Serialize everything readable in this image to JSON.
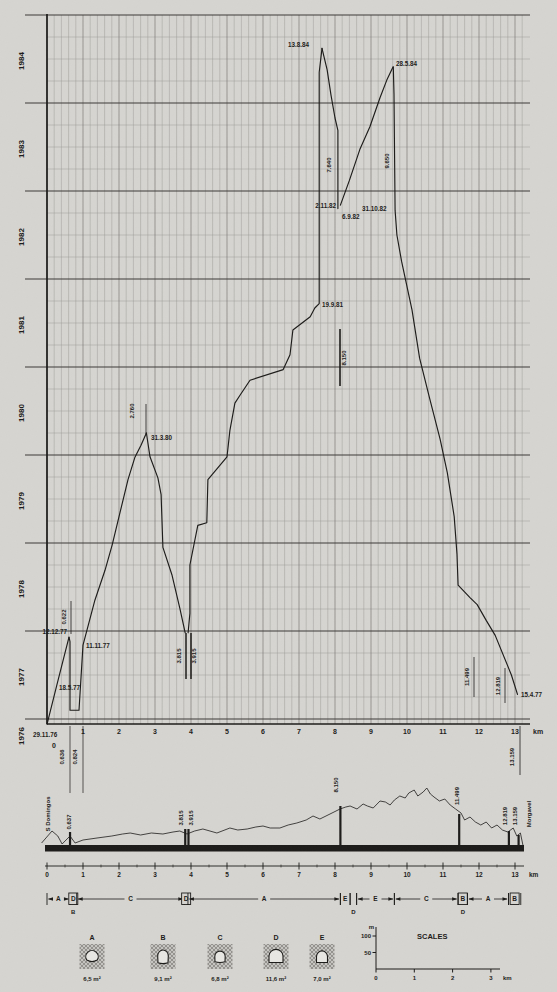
{
  "page": {
    "bg": "#d6d5d1",
    "ink": "#1c1b19",
    "grid_minor": "#9a9994",
    "grid_major": "#3c3b38"
  },
  "chart_data": {
    "type": "line",
    "x_unit": "km",
    "x_range": [
      0,
      13.4
    ],
    "x_ticks": [
      "0",
      "1",
      "2",
      "3",
      "4",
      "5",
      "6",
      "7",
      "8",
      "9",
      "10",
      "11",
      "12",
      "13"
    ],
    "year_labels": [
      "1976",
      "1977",
      "1978",
      "1979",
      "1980",
      "1981",
      "1982",
      "1983",
      "1984"
    ],
    "grid": "on",
    "series": [
      {
        "name": "S. Domingos portal heading",
        "points": [
          [
            0,
            1976.94
          ],
          [
            0.27,
            1977.38
          ],
          [
            0.61,
            1977.93
          ]
        ]
      },
      {
        "name": "adit 0.824 heading east",
        "points": [
          [
            0.61,
            1977.93
          ],
          [
            0.64,
            1977.88
          ],
          [
            0.64,
            1977.1
          ],
          [
            0.89,
            1977.1
          ],
          [
            1.0,
            1977.84
          ],
          [
            1.33,
            1978.35
          ],
          [
            1.61,
            1978.69
          ],
          [
            1.81,
            1978.98
          ],
          [
            2.03,
            1979.35
          ],
          [
            2.25,
            1979.72
          ],
          [
            2.44,
            1979.97
          ],
          [
            2.61,
            1980.11
          ],
          [
            2.76,
            1980.25
          ]
        ]
      },
      {
        "name": "adit 3.815 heading west",
        "points": [
          [
            2.76,
            1980.25
          ],
          [
            2.86,
            1979.98
          ],
          [
            3.08,
            1979.74
          ],
          [
            3.17,
            1979.55
          ],
          [
            3.22,
            1978.95
          ],
          [
            3.47,
            1978.64
          ],
          [
            3.69,
            1978.26
          ],
          [
            3.84,
            1977.98
          ]
        ]
      },
      {
        "name": "adit 3.915 heading east",
        "points": [
          [
            3.92,
            1977.98
          ],
          [
            3.97,
            1978.2
          ],
          [
            3.97,
            1978.75
          ],
          [
            4.19,
            1979.2
          ],
          [
            4.44,
            1979.23
          ],
          [
            4.47,
            1979.72
          ],
          [
            5.0,
            1979.98
          ],
          [
            5.08,
            1980.28
          ],
          [
            5.22,
            1980.59
          ],
          [
            5.36,
            1980.68
          ],
          [
            5.64,
            1980.85
          ],
          [
            6.56,
            1980.97
          ],
          [
            6.75,
            1981.14
          ],
          [
            6.83,
            1981.42
          ],
          [
            7.31,
            1981.57
          ],
          [
            7.44,
            1981.67
          ],
          [
            7.56,
            1981.72
          ],
          [
            7.56,
            1984.35
          ],
          [
            7.64,
            1984.62
          ]
        ]
      },
      {
        "name": "adit 8.150 heading west",
        "points": [
          [
            7.64,
            1984.62
          ],
          [
            7.78,
            1984.38
          ],
          [
            7.89,
            1984.09
          ],
          [
            8.0,
            1983.83
          ],
          [
            8.08,
            1983.69
          ],
          [
            8.08,
            1982.8
          ]
        ]
      },
      {
        "name": "adit 8.150 heading east",
        "points": [
          [
            8.15,
            1982.84
          ],
          [
            8.4,
            1983.12
          ],
          [
            8.69,
            1983.47
          ],
          [
            8.97,
            1983.73
          ],
          [
            9.25,
            1984.06
          ],
          [
            9.44,
            1984.26
          ],
          [
            9.61,
            1984.41
          ]
        ]
      },
      {
        "name": "Morgavel portal heading",
        "points": [
          [
            13.07,
            1977.28
          ],
          [
            12.9,
            1977.5
          ],
          [
            12.45,
            1977.95
          ],
          [
            12.2,
            1978.12
          ],
          [
            11.95,
            1978.3
          ],
          [
            11.75,
            1978.38
          ],
          [
            11.42,
            1978.52
          ],
          [
            11.39,
            1978.87
          ],
          [
            11.31,
            1979.3
          ],
          [
            11.12,
            1979.8
          ],
          [
            10.92,
            1980.18
          ],
          [
            10.63,
            1980.64
          ],
          [
            10.35,
            1981.1
          ],
          [
            10.14,
            1981.65
          ],
          [
            9.85,
            1982.2
          ],
          [
            9.72,
            1982.5
          ],
          [
            9.67,
            1982.78
          ],
          [
            9.65,
            1983.6
          ],
          [
            9.64,
            1984.1
          ],
          [
            9.62,
            1984.41
          ]
        ]
      }
    ],
    "date_labels": [
      {
        "t": "13.8.84",
        "x": 288,
        "y": 47,
        "a": "start"
      },
      {
        "t": "28.5.84",
        "x": 396,
        "y": 66,
        "a": "start"
      },
      {
        "t": "2.11.82",
        "x": 336,
        "y": 208,
        "a": "end"
      },
      {
        "t": "6.9.82",
        "x": 342,
        "y": 219,
        "a": "start"
      },
      {
        "t": "31.10.82",
        "x": 362,
        "y": 211,
        "a": "start"
      },
      {
        "t": "19.9.81",
        "x": 322,
        "y": 307,
        "a": "start"
      },
      {
        "t": "31.3.80",
        "x": 151,
        "y": 440,
        "a": "start"
      },
      {
        "t": "12.12.77",
        "x": 67,
        "y": 634,
        "a": "end"
      },
      {
        "t": "11.11.77",
        "x": 86,
        "y": 648,
        "a": "start"
      },
      {
        "t": "18.5.77",
        "x": 59,
        "y": 690,
        "a": "start"
      },
      {
        "t": "29.11.76",
        "x": 33,
        "y": 737,
        "a": "start"
      },
      {
        "t": "15.4.77",
        "x": 521,
        "y": 697,
        "a": "start"
      }
    ],
    "chainage_labels": [
      {
        "t": "0.622",
        "x": 66,
        "y": 617,
        "line": [
          71,
          601,
          634
        ],
        "lw": 0.8
      },
      {
        "t": "2.760",
        "x": 134,
        "y": 411,
        "line": [
          146,
          404,
          434
        ],
        "lw": 0.8
      },
      {
        "t": "3.815",
        "x": 181,
        "y": 656,
        "line": [
          186,
          633,
          679
        ],
        "lw": 1.5
      },
      {
        "t": "3.915",
        "x": 196,
        "y": 656,
        "line": [
          191,
          633,
          679
        ],
        "lw": 1.5
      },
      {
        "t": "7.640",
        "x": 331,
        "y": 165
      },
      {
        "t": "8.150",
        "x": 346,
        "y": 358,
        "line": [
          340,
          329,
          386
        ],
        "lw": 1.6
      },
      {
        "t": "9.650",
        "x": 389,
        "y": 161
      },
      {
        "t": "11.499",
        "x": 469,
        "y": 677,
        "line": [
          474,
          657,
          697
        ],
        "lw": 0.8
      },
      {
        "t": "12.819",
        "x": 500,
        "y": 686,
        "line": [
          505,
          668,
          703
        ],
        "lw": 0.8
      },
      {
        "t": "0.636",
        "x": 64,
        "y": 757,
        "line": [
          70,
          726,
          793
        ],
        "lw": 0.7
      },
      {
        "t": "0.824",
        "x": 77,
        "y": 757,
        "line": [
          83,
          726,
          793
        ],
        "lw": 0.7
      },
      {
        "t": "13.159",
        "x": 514,
        "y": 757,
        "line": [
          520,
          726,
          775
        ],
        "lw": 0.8
      }
    ],
    "x_axis_unit_label": "km",
    "zero_tick": {
      "t": "0",
      "x": 54,
      "y": 748
    }
  },
  "profile": {
    "left_name": "S Domingos",
    "right_name": "Morgavel",
    "terrain": [
      [
        -0.15,
        3
      ],
      [
        0.14,
        15
      ],
      [
        0.3,
        10
      ],
      [
        0.42,
        2
      ],
      [
        0.64,
        10
      ],
      [
        0.78,
        3
      ],
      [
        1.0,
        6
      ],
      [
        1.39,
        8
      ],
      [
        1.8,
        10
      ],
      [
        2.1,
        12
      ],
      [
        2.31,
        13
      ],
      [
        2.6,
        11
      ],
      [
        2.9,
        13
      ],
      [
        3.22,
        12
      ],
      [
        3.5,
        14
      ],
      [
        3.69,
        15
      ],
      [
        3.89,
        12
      ],
      [
        4.1,
        15
      ],
      [
        4.33,
        17
      ],
      [
        4.72,
        13
      ],
      [
        5.08,
        18
      ],
      [
        5.3,
        16
      ],
      [
        5.56,
        17
      ],
      [
        5.8,
        19
      ],
      [
        6.0,
        20
      ],
      [
        6.2,
        18
      ],
      [
        6.47,
        18
      ],
      [
        6.7,
        21
      ],
      [
        6.94,
        23
      ],
      [
        7.2,
        26
      ],
      [
        7.39,
        30
      ],
      [
        7.58,
        27
      ],
      [
        7.86,
        32
      ],
      [
        8.14,
        37
      ],
      [
        8.3,
        39
      ],
      [
        8.42,
        40
      ],
      [
        8.61,
        37
      ],
      [
        8.78,
        42
      ],
      [
        8.9,
        40
      ],
      [
        9.06,
        38
      ],
      [
        9.25,
        45
      ],
      [
        9.4,
        44
      ],
      [
        9.53,
        41
      ],
      [
        9.65,
        46
      ],
      [
        9.8,
        50
      ],
      [
        9.95,
        48
      ],
      [
        10.05,
        53
      ],
      [
        10.2,
        56
      ],
      [
        10.3,
        50
      ],
      [
        10.45,
        54
      ],
      [
        10.55,
        58
      ],
      [
        10.65,
        52
      ],
      [
        10.75,
        49
      ],
      [
        10.9,
        45
      ],
      [
        11.05,
        47
      ],
      [
        11.2,
        41
      ],
      [
        11.35,
        37
      ],
      [
        11.5,
        33
      ],
      [
        11.6,
        26
      ],
      [
        11.75,
        29
      ],
      [
        11.9,
        24
      ],
      [
        12.05,
        21
      ],
      [
        12.2,
        24
      ],
      [
        12.35,
        18
      ],
      [
        12.5,
        21
      ],
      [
        12.65,
        16
      ],
      [
        12.8,
        14
      ],
      [
        12.95,
        18
      ],
      [
        13.05,
        10
      ],
      [
        13.15,
        13
      ],
      [
        13.22,
        1
      ]
    ],
    "shafts": [
      {
        "km": 0.64,
        "el": 14
      },
      {
        "km": 3.84,
        "el": 17
      },
      {
        "km": 3.93,
        "el": 17
      },
      {
        "km": 8.15,
        "el": 40
      },
      {
        "km": 11.45,
        "el": 32
      },
      {
        "km": 12.83,
        "el": 15
      },
      {
        "km": 13.1,
        "el": 11
      }
    ],
    "labels": [
      {
        "t": "S Domingos",
        "x": 50,
        "y": 814,
        "size": 6
      },
      {
        "t": "0.637",
        "x": 71,
        "y": 822
      },
      {
        "t": "3.815",
        "x": 183,
        "y": 818
      },
      {
        "t": "3.915",
        "x": 193,
        "y": 818
      },
      {
        "t": "8.150",
        "x": 338,
        "y": 785
      },
      {
        "t": "11.499",
        "x": 459,
        "y": 796
      },
      {
        "t": "12.819",
        "x": 507,
        "y": 816
      },
      {
        "t": "13.159",
        "x": 517,
        "y": 816
      },
      {
        "t": "Morgavel",
        "x": 531,
        "y": 814,
        "size": 6
      }
    ],
    "x_ticks": [
      "0",
      "1",
      "2",
      "3",
      "4",
      "5",
      "6",
      "7",
      "8",
      "9",
      "10",
      "11",
      "12",
      "13"
    ],
    "x_unit": "km"
  },
  "sections": {
    "spans": [
      {
        "a": 0,
        "b": 0.637,
        "l": "A",
        "box": false
      },
      {
        "a": 0.637,
        "b": 0.824,
        "l": "D",
        "box": true
      },
      {
        "a": 0.824,
        "b": 3.815,
        "l": "C",
        "box": false
      },
      {
        "a": 3.815,
        "b": 3.915,
        "l": "D",
        "box": true
      },
      {
        "a": 3.915,
        "b": 8.15,
        "l": "A",
        "box": false
      },
      {
        "a": 8.15,
        "b": 8.42,
        "l": "E",
        "box": false
      },
      {
        "a": 8.42,
        "b": 8.6,
        "l": "",
        "box": false
      },
      {
        "a": 8.6,
        "b": 9.65,
        "l": "E",
        "box": false
      },
      {
        "a": 9.65,
        "b": 11.42,
        "l": "C",
        "box": false
      },
      {
        "a": 11.42,
        "b": 11.68,
        "l": "B",
        "box": true
      },
      {
        "a": 11.68,
        "b": 12.82,
        "l": "A",
        "box": false
      },
      {
        "a": 12.82,
        "b": 13.16,
        "l": "B",
        "box": true
      }
    ],
    "sub_labels": [
      {
        "t": "B",
        "km": 0.73
      },
      {
        "t": "D",
        "km": 8.51
      },
      {
        "t": "D",
        "km": 11.55
      }
    ]
  },
  "legend": {
    "items": [
      {
        "letter": "A",
        "area": "6,5 m²"
      },
      {
        "letter": "B",
        "area": "9,1 m²"
      },
      {
        "letter": "C",
        "area": "6,8 m²"
      },
      {
        "letter": "D",
        "area": "11,6 m²"
      },
      {
        "letter": "E",
        "area": "7,0 m²"
      }
    ]
  },
  "scales": {
    "title": "SCALES",
    "v_unit": "m",
    "v_ticks": [
      "100",
      "50"
    ],
    "h_ticks": [
      "0",
      "1",
      "2",
      "3"
    ],
    "h_unit": "km"
  }
}
